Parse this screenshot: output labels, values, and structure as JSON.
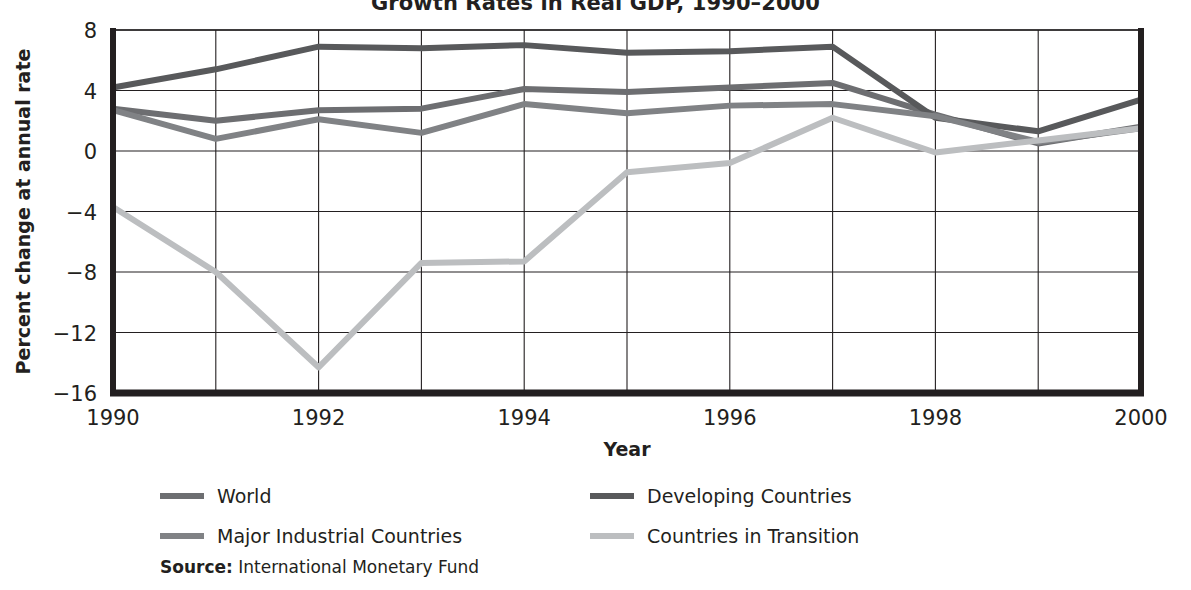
{
  "chart_data": {
    "type": "line",
    "title": "Growth Rates in Real GDP, 1990–2000",
    "xlabel": "Year",
    "ylabel": "Percent change at annual rate",
    "x": [
      1990,
      1991,
      1992,
      1993,
      1994,
      1995,
      1996,
      1997,
      1998,
      1999,
      2000
    ],
    "xtick_labels": [
      "1990",
      "",
      "1992",
      "",
      "1994",
      "",
      "1996",
      "",
      "1998",
      "",
      "2000"
    ],
    "xlim": [
      1990,
      2000
    ],
    "ylim": [
      -16,
      8
    ],
    "ytick_labels": [
      "8",
      "4",
      "0",
      "−4",
      "−8",
      "−12",
      "−16"
    ],
    "yticks": [
      8,
      4,
      0,
      -4,
      -8,
      -12,
      -16
    ],
    "grid": "both",
    "legend_position": "below-plot",
    "series": [
      {
        "name": "World",
        "color": "#6d6e71",
        "values": [
          2.8,
          2.0,
          2.7,
          2.8,
          4.1,
          3.9,
          4.2,
          4.5,
          2.4,
          0.5,
          1.6
        ]
      },
      {
        "name": "Developing Countries",
        "color": "#58595b",
        "values": [
          4.2,
          5.4,
          6.9,
          6.8,
          7.0,
          6.5,
          6.6,
          6.9,
          2.2,
          1.3,
          3.4
        ]
      },
      {
        "name": "Major Industrial Countries",
        "color": "#808285",
        "values": [
          2.7,
          0.8,
          2.1,
          1.2,
          3.1,
          2.5,
          3.0,
          3.1,
          2.3,
          0.6,
          1.5
        ]
      },
      {
        "name": "Countries in Transition",
        "color": "#bcbec0",
        "values": [
          -3.7,
          -8.0,
          -14.3,
          -7.4,
          -7.3,
          -1.4,
          -0.8,
          2.2,
          -0.1,
          0.7,
          1.5
        ]
      }
    ]
  },
  "legend": {
    "rows": [
      [
        {
          "label": "World",
          "color": "#6d6e71"
        },
        {
          "label": "Developing Countries",
          "color": "#58595b"
        }
      ],
      [
        {
          "label": "Major Industrial Countries",
          "color": "#808285"
        },
        {
          "label": "Countries in Transition",
          "color": "#bcbec0"
        }
      ]
    ]
  },
  "source": {
    "key": "Source:",
    "text": " International Monetary Fund"
  },
  "style": {
    "axis_color": "#231f20",
    "grid_color": "#231f20",
    "background": "#ffffff"
  }
}
